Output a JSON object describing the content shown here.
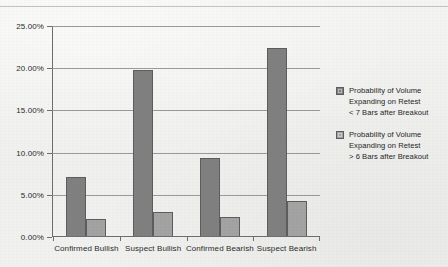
{
  "chart_data": {
    "type": "bar",
    "title": "",
    "xlabel": "",
    "ylabel": "",
    "ylim": [
      0,
      25
    ],
    "grid": true,
    "legend_position": "right",
    "categories": [
      "Confirmed Bullish",
      "Suspect Bullish",
      "Confirmed Bearish",
      "Suspect Bearish"
    ],
    "ytick_labels": [
      "25.00%",
      "20.00%",
      "15.00%",
      "10.00%",
      "5.00%",
      "0.00%"
    ],
    "ytick_values": [
      25,
      20,
      15,
      10,
      5,
      0
    ],
    "series": [
      {
        "name": "Probability of Volume Expanding on Retest < 7 Bars after Breakout",
        "name_lines": [
          "Probability of Volume",
          "Expanding on Retest",
          "< 7 Bars after Breakout"
        ],
        "color": "#808080",
        "values": [
          7.0,
          19.7,
          9.2,
          22.3
        ]
      },
      {
        "name": "Probability of Volume Expanding on Retest > 6 Bars after Breakout",
        "name_lines": [
          "Probability of Volume",
          "Expanding on Retest",
          "> 6 Bars after Breakout"
        ],
        "color": "#a3a3a3",
        "values": [
          2.0,
          2.9,
          2.2,
          4.2
        ]
      }
    ]
  }
}
